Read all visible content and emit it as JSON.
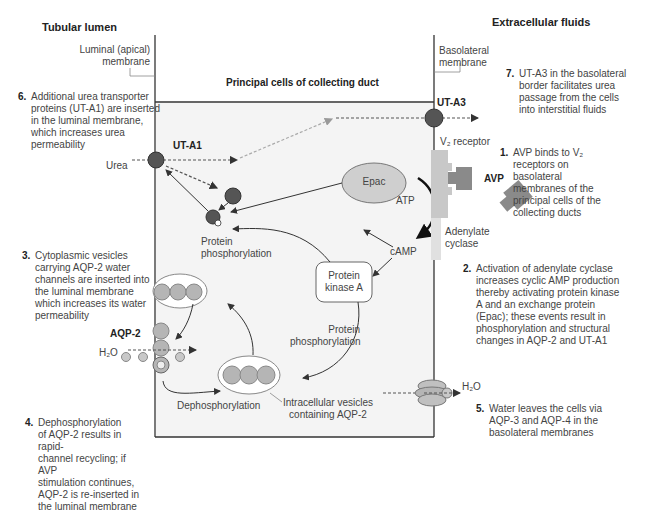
{
  "headers": {
    "left": "Tubular lumen",
    "right": "Extracellular fluids",
    "center": "Principal cells of collecting duct"
  },
  "membranes": {
    "luminal_line1": "Luminal (apical)",
    "luminal_line2": "membrane",
    "basolateral_line1": "Basolateral",
    "basolateral_line2": "membrane"
  },
  "labels": {
    "ut_a1": "UT-A1",
    "ut_a3": "UT-A3",
    "urea": "Urea",
    "v2_receptor": "V₂ receptor",
    "avp": "AVP",
    "atp": "ATP",
    "camp": "cAMP",
    "adenylate_line1": "Adenylate",
    "adenylate_line2": "cyclase",
    "epac": "Epac",
    "pka_line1": "Protein",
    "pka_line2": "kinase A",
    "protein_phos1_line1": "Protein",
    "protein_phos1_line2": "phosphorylation",
    "protein_phos2_line1": "Protein",
    "protein_phos2_line2": "phosphorylation",
    "aqp2": "AQP-2",
    "h2o_left": "H₂O",
    "h2o_right": "H₂O",
    "dephosphorylation": "Dephosphorylation",
    "vesicles_line1": "Intracellular vesicles",
    "vesicles_line2": "containing AQP-2"
  },
  "notes": [
    {
      "num": "1.",
      "lines": [
        "AVP binds to V₂",
        "receptors on",
        "basolateral",
        "membranes of the",
        "principal cells of the",
        "collecting ducts"
      ]
    },
    {
      "num": "2.",
      "lines": [
        "Activation of adenylate cyclase",
        "increases cyclic AMP production",
        "thereby activating protein kinase",
        " A and an exchange protein",
        "(Epac); these events result in",
        "phosphorylation and structural",
        "changes in AQP-2 and UT-A1"
      ]
    },
    {
      "num": "3.",
      "lines": [
        "Cytoplasmic vesicles",
        "carrying AQP-2 water",
        "channels are inserted into",
        "the luminal membrane",
        "which increases its water",
        "permeability"
      ]
    },
    {
      "num": "4.",
      "lines": [
        "Dephosphorylation",
        "of AQP-2 results in rapid-",
        "channel recycling; if AVP",
        "stimulation continues,",
        "AQP-2 is re-inserted in",
        "the luminal membrane"
      ]
    },
    {
      "num": "5.",
      "lines": [
        "Water leaves the cells via",
        "AQP-3 and AQP-4 in the",
        "basolateral membranes"
      ]
    },
    {
      "num": "6.",
      "lines": [
        "Additional urea transporter",
        "proteins (UT-A1) are inserted",
        "in the luminal membrane,",
        "which increases urea",
        "permeability"
      ]
    },
    {
      "num": "7.",
      "lines": [
        "UT-A3 in the basolateral",
        "border facilitates urea",
        "passage from the cells",
        "into interstitial fluids"
      ]
    }
  ],
  "colors": {
    "cell_bg": "#f4f4f4",
    "dark_protein": "#555555",
    "aqp_gray": "#b5b5b5",
    "receptor": "#c8c8c8",
    "avp": "#8a8a8a",
    "line": "#333333"
  }
}
